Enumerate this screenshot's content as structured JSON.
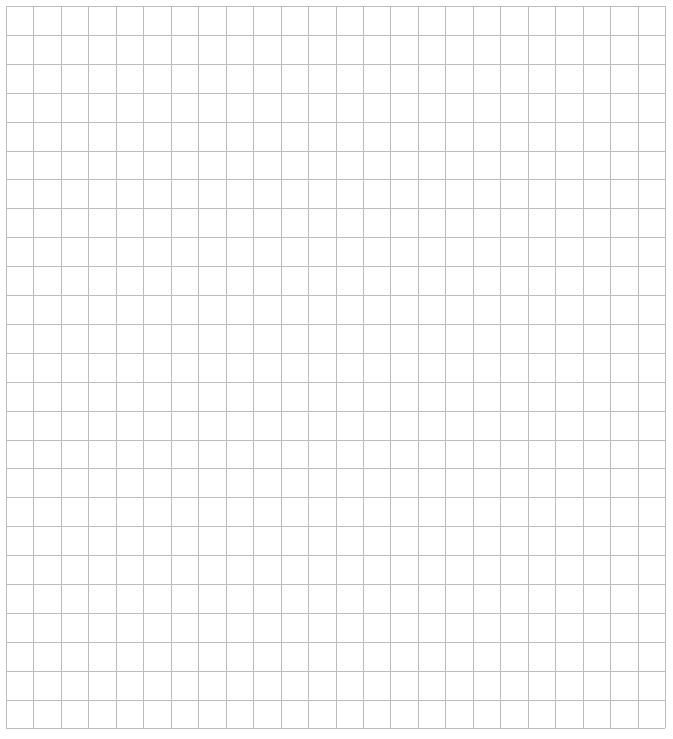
{
  "page": {
    "background": "#ffffff"
  },
  "grid": {
    "left": 6,
    "top": 6,
    "right": 665,
    "bottom": 728,
    "columns": 24,
    "rows": 25,
    "col_pitch": 27.46,
    "row_pitch": 28.9,
    "line_color": "#bdbdbd",
    "line_width": 1
  }
}
